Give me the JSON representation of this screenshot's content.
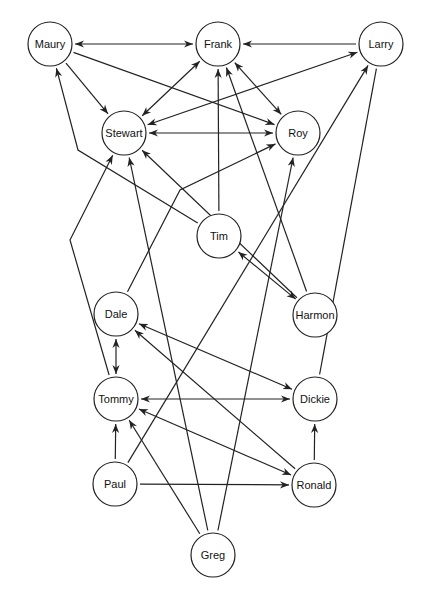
{
  "diagram": {
    "type": "directed-network",
    "node_radius": 22,
    "colors": {
      "stroke": "#222222",
      "background": "#ffffff",
      "text": "#111111"
    },
    "nodes": [
      {
        "id": "maury",
        "label": "Maury",
        "x": 50,
        "y": 44
      },
      {
        "id": "frank",
        "label": "Frank",
        "x": 218,
        "y": 44
      },
      {
        "id": "larry",
        "label": "Larry",
        "x": 381,
        "y": 44
      },
      {
        "id": "stewart",
        "label": "Stewart",
        "x": 124,
        "y": 133
      },
      {
        "id": "roy",
        "label": "Roy",
        "x": 298,
        "y": 133
      },
      {
        "id": "tim",
        "label": "Tim",
        "x": 219,
        "y": 236
      },
      {
        "id": "harmon",
        "label": "Harmon",
        "x": 315,
        "y": 315
      },
      {
        "id": "dale",
        "label": "Dale",
        "x": 116,
        "y": 314
      },
      {
        "id": "tommy",
        "label": "Tommy",
        "x": 116,
        "y": 399
      },
      {
        "id": "dickie",
        "label": "Dickie",
        "x": 315,
        "y": 399
      },
      {
        "id": "paul",
        "label": "Paul",
        "x": 115,
        "y": 484
      },
      {
        "id": "ronald",
        "label": "Ronald",
        "x": 314,
        "y": 485
      },
      {
        "id": "greg",
        "label": "Greg",
        "x": 213,
        "y": 555
      }
    ],
    "edges": [
      {
        "from": "maury",
        "to": "frank",
        "dir": "both"
      },
      {
        "from": "maury",
        "to": "stewart",
        "dir": "forward"
      },
      {
        "from": "maury",
        "to": "roy",
        "dir": "forward"
      },
      {
        "from": "frank",
        "to": "stewart",
        "dir": "both"
      },
      {
        "from": "frank",
        "to": "roy",
        "dir": "both"
      },
      {
        "from": "larry",
        "to": "frank",
        "dir": "forward"
      },
      {
        "from": "stewart",
        "to": "larry",
        "dir": "both"
      },
      {
        "from": "stewart",
        "to": "roy",
        "dir": "both"
      },
      {
        "from": "tim",
        "to": "maury",
        "dir": "forward",
        "via": [
          [
            78,
            150
          ]
        ]
      },
      {
        "from": "tim",
        "to": "frank",
        "dir": "forward"
      },
      {
        "from": "harmon",
        "to": "stewart",
        "dir": "forward"
      },
      {
        "from": "harmon",
        "to": "frank",
        "dir": "forward"
      },
      {
        "from": "tim",
        "to": "harmon",
        "dir": "both"
      },
      {
        "from": "dale",
        "to": "roy",
        "dir": "forward",
        "via": [
          [
            180,
            190
          ]
        ]
      },
      {
        "from": "tommy",
        "to": "stewart",
        "dir": "forward",
        "via": [
          [
            70,
            240
          ]
        ]
      },
      {
        "from": "greg",
        "to": "stewart",
        "dir": "forward"
      },
      {
        "from": "greg",
        "to": "roy",
        "dir": "forward"
      },
      {
        "from": "paul",
        "to": "larry",
        "dir": "forward"
      },
      {
        "from": "dickie",
        "to": "larry",
        "dir": "none"
      },
      {
        "from": "dale",
        "to": "dickie",
        "dir": "both"
      },
      {
        "from": "ronald",
        "to": "dale",
        "dir": "forward"
      },
      {
        "from": "dale",
        "to": "tommy",
        "dir": "both"
      },
      {
        "from": "tommy",
        "to": "dickie",
        "dir": "both"
      },
      {
        "from": "tommy",
        "to": "ronald",
        "dir": "both"
      },
      {
        "from": "paul",
        "to": "tommy",
        "dir": "forward"
      },
      {
        "from": "greg",
        "to": "tommy",
        "dir": "forward"
      },
      {
        "from": "paul",
        "to": "ronald",
        "dir": "forward"
      },
      {
        "from": "ronald",
        "to": "dickie",
        "dir": "forward"
      }
    ]
  }
}
